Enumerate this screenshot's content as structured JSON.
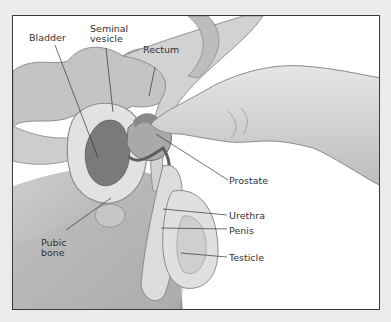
{
  "diagram": {
    "type": "anatomical-illustration",
    "labels": [
      {
        "id": "bladder",
        "text": "Bladder"
      },
      {
        "id": "seminal_vesicle",
        "line1": "Seminal",
        "line2": "vesicle"
      },
      {
        "id": "rectum",
        "text": "Rectum"
      },
      {
        "id": "prostate",
        "text": "Prostate"
      },
      {
        "id": "urethra",
        "text": "Urethra"
      },
      {
        "id": "pubic_bone",
        "line1": "Pubic",
        "line2": "bone"
      },
      {
        "id": "penis",
        "text": "Penis"
      },
      {
        "id": "testicle",
        "text": "Testicle"
      }
    ]
  },
  "colors": {
    "background": "#ebebeb",
    "frame_border": "#3a3a3a",
    "panel": "#ffffff",
    "tissue_light": "#d9d9d9",
    "tissue_mid": "#bdbdbd",
    "tissue_dark": "#8a8a8a",
    "organ_dark": "#6e6e6e",
    "leader_line": "#333333"
  }
}
